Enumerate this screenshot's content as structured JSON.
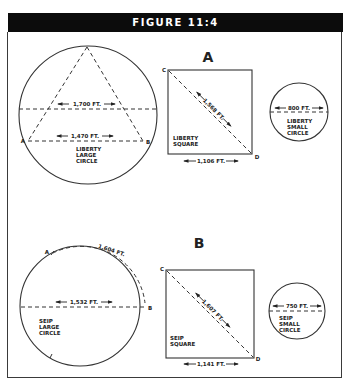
{
  "figure": {
    "title": "FIGURE 11:4"
  },
  "panel_a": {
    "heading": "A",
    "large_circle": {
      "name_lines": [
        "LIBERTY",
        "LARGE",
        "CIRCLE"
      ],
      "upper_chord_label": "1,700 FT.",
      "lower_chord_label": "1,470 FT.",
      "point_a": "A",
      "point_b": "B"
    },
    "square": {
      "name_lines": [
        "LIBERTY",
        "SQUARE"
      ],
      "diagonal_label": "1,568 FT.",
      "side_label": "1,106 FT.",
      "point_c": "C",
      "point_d": "D"
    },
    "small_circle": {
      "name_lines": [
        "LIBERTY",
        "SMALL",
        "CIRCLE"
      ],
      "diameter_label": "800 FT."
    }
  },
  "panel_b": {
    "heading": "B",
    "large_circle": {
      "name_lines": [
        "SEIP",
        "LARGE",
        "CIRCLE"
      ],
      "diameter_label": "1,532 FT.",
      "arc_label": "1,604 FT.",
      "point_a": "A",
      "point_b": "B"
    },
    "square": {
      "name_lines": [
        "SEIP",
        "SQUARE"
      ],
      "diagonal_label": "1,607 FT.",
      "side_label": "1,141 FT.",
      "point_c": "C",
      "point_d": "D"
    },
    "small_circle": {
      "name_lines": [
        "SEIP",
        "SMALL",
        "CIRCLE"
      ],
      "diameter_label": "750 FT."
    }
  }
}
